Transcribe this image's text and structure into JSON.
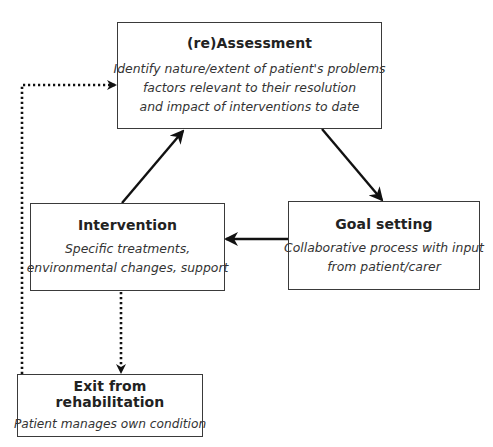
{
  "diagram": {
    "type": "rehabilitation-cycle-flowchart",
    "nodes": [
      {
        "id": "assessment",
        "title": "(re)Assessment",
        "body": [
          "Identify nature/extent of patient's problems",
          "factors relevant to their resolution",
          "and impact of interventions to date"
        ]
      },
      {
        "id": "goal_setting",
        "title": "Goal setting",
        "body": [
          "Collaborative process with input",
          "from patient/carer"
        ]
      },
      {
        "id": "intervention",
        "title": "Intervention",
        "body": [
          "Specific treatments,",
          "environmental changes, support"
        ]
      },
      {
        "id": "exit",
        "title": "Exit from rehabilitation",
        "body": [
          "Patient manages own condition"
        ]
      }
    ],
    "edges": [
      {
        "from": "assessment",
        "to": "goal_setting",
        "style": "solid"
      },
      {
        "from": "goal_setting",
        "to": "intervention",
        "style": "solid"
      },
      {
        "from": "intervention",
        "to": "assessment",
        "style": "solid"
      },
      {
        "from": "intervention",
        "to": "exit",
        "style": "dotted"
      },
      {
        "from": "exit",
        "to": "assessment",
        "style": "dotted"
      }
    ],
    "colors": {
      "line": "#111111",
      "border": "#3a3a3a",
      "background": "#ffffff"
    }
  }
}
